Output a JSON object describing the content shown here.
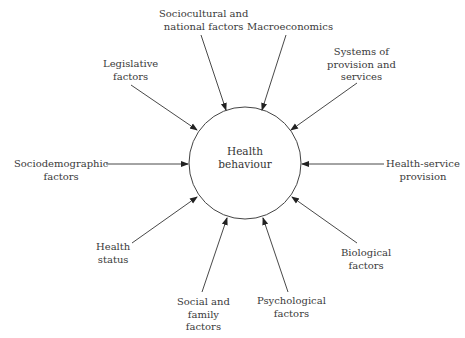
{
  "center": {
    "line1": "Health",
    "line2": "behaviour"
  },
  "factors": [
    {
      "id": "sociocultural",
      "lines": [
        "Sociocultural and",
        "national factors"
      ]
    },
    {
      "id": "macroeconomics",
      "lines": [
        "Macroeconomics"
      ]
    },
    {
      "id": "systems",
      "lines": [
        "Systems of",
        "provision and",
        "services"
      ]
    },
    {
      "id": "legislative",
      "lines": [
        "Legislative",
        "factors"
      ]
    },
    {
      "id": "sociodemographic",
      "lines": [
        "Sociodemographic",
        "factors"
      ]
    },
    {
      "id": "health-service",
      "lines": [
        "Health-service",
        "provision"
      ]
    },
    {
      "id": "health-status",
      "lines": [
        "Health",
        "status"
      ]
    },
    {
      "id": "biological",
      "lines": [
        "Biological",
        "factors"
      ]
    },
    {
      "id": "social-family",
      "lines": [
        "Social and",
        "family",
        "factors"
      ]
    },
    {
      "id": "psychological",
      "lines": [
        "Psychological",
        "factors"
      ]
    }
  ],
  "colors": {
    "line": "#333333",
    "text": "#3a3a3a"
  }
}
